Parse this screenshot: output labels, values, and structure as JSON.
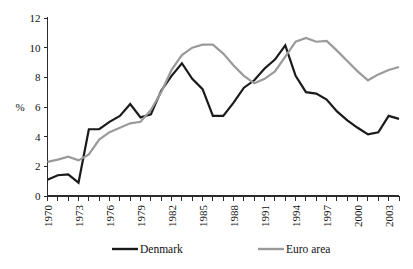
{
  "chart_data": {
    "type": "line",
    "title": "",
    "subtitle": "",
    "xlabel": "",
    "ylabel": "%",
    "xlim": [
      1970,
      2004
    ],
    "ylim": [
      0,
      12
    ],
    "grid": false,
    "legend_position": "bottom",
    "y_ticks": [
      0,
      2,
      4,
      6,
      8,
      10,
      12
    ],
    "y_tick_labels": [
      "0",
      "2",
      "4",
      "6",
      "8",
      "10",
      "12"
    ],
    "x_ticks": [
      1970,
      1971,
      1972,
      1973,
      1974,
      1975,
      1976,
      1977,
      1978,
      1979,
      1980,
      1981,
      1982,
      1983,
      1984,
      1985,
      1986,
      1987,
      1988,
      1989,
      1990,
      1991,
      1992,
      1993,
      1994,
      1995,
      1996,
      1997,
      1998,
      1999,
      2000,
      2001,
      2002,
      2003,
      2004
    ],
    "x_tick_labels": [
      "1970",
      "",
      "",
      "1973",
      "",
      "",
      "1976",
      "",
      "",
      "1979",
      "",
      "",
      "1982",
      "",
      "",
      "1985",
      "",
      "",
      "1988",
      "",
      "",
      "1991",
      "",
      "",
      "1994",
      "",
      "",
      "1997",
      "",
      "",
      "2000",
      "",
      "",
      "2003",
      ""
    ],
    "x": [
      1970,
      1971,
      1972,
      1973,
      1974,
      1975,
      1976,
      1977,
      1978,
      1979,
      1980,
      1981,
      1982,
      1983,
      1984,
      1985,
      1986,
      1987,
      1988,
      1989,
      1990,
      1991,
      1992,
      1993,
      1994,
      1995,
      1996,
      1997,
      1998,
      1999,
      2000,
      2001,
      2002,
      2003,
      2004
    ],
    "series": [
      {
        "name": "Denmark",
        "color": "#1a1a1a",
        "width": 2.2,
        "values": [
          1.1,
          1.4,
          1.45,
          0.9,
          4.5,
          4.5,
          5.0,
          5.4,
          6.2,
          5.3,
          5.5,
          7.1,
          8.1,
          8.95,
          7.9,
          7.2,
          5.4,
          5.4,
          6.3,
          7.3,
          7.8,
          8.6,
          9.2,
          10.15,
          8.1,
          7.0,
          6.9,
          6.5,
          5.7,
          5.1,
          4.6,
          4.15,
          4.3,
          5.4,
          5.2
        ]
      },
      {
        "name": "Euro area",
        "color": "#9a9a9a",
        "width": 2.2,
        "values": [
          2.3,
          2.45,
          2.65,
          2.4,
          2.8,
          3.8,
          4.3,
          4.6,
          4.9,
          5.0,
          5.8,
          7.0,
          8.5,
          9.5,
          10.0,
          10.2,
          10.2,
          9.6,
          8.8,
          8.1,
          7.6,
          7.9,
          8.4,
          9.4,
          10.4,
          10.65,
          10.4,
          10.45,
          9.8,
          9.1,
          8.4,
          7.8,
          8.2,
          8.5,
          8.7
        ]
      }
    ],
    "legend": [
      {
        "label": "Denmark",
        "color": "#1a1a1a"
      },
      {
        "label": "Euro area",
        "color": "#9a9a9a"
      }
    ]
  }
}
